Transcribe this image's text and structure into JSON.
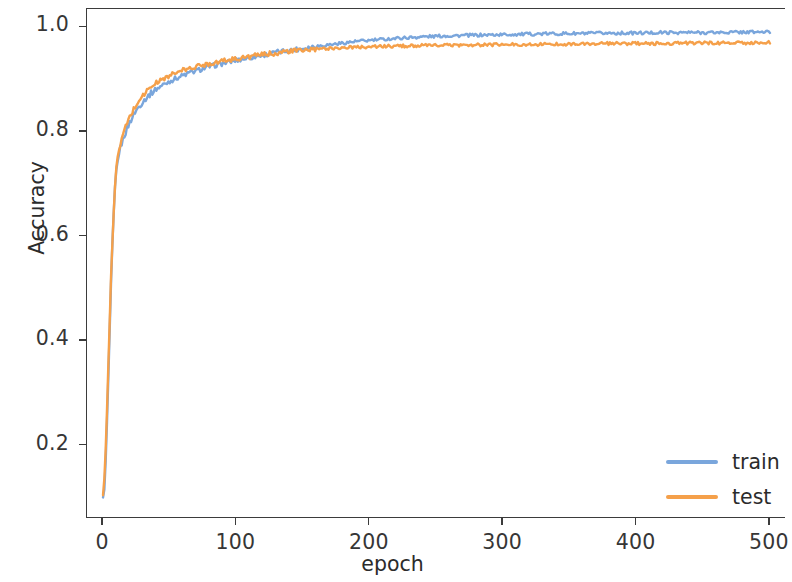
{
  "chart_data": {
    "type": "line",
    "title": "",
    "xlabel": "epoch",
    "ylabel": "Accuracy",
    "xlim": [
      -12,
      512
    ],
    "ylim": [
      0.06,
      1.035
    ],
    "xticks": [
      0,
      100,
      200,
      300,
      400,
      500
    ],
    "xticklabels": [
      "0",
      "100",
      "200",
      "300",
      "400",
      "500"
    ],
    "yticks": [
      0.2,
      0.4,
      0.6,
      0.8,
      1.0
    ],
    "yticklabels": [
      "0.2",
      "0.4",
      "0.6",
      "0.8",
      "1.0"
    ],
    "grid": false,
    "legend_position": "lower right",
    "colors": {
      "train": "#7aa6dc",
      "test": "#f5a04a",
      "axis": "#3b3b3b",
      "text": "#2b2b2b",
      "background": "#ffffff"
    },
    "series": [
      {
        "name": "train",
        "color": "#7aa6dc",
        "x": [
          0,
          1,
          2,
          3,
          4,
          5,
          6,
          7,
          8,
          9,
          10,
          12,
          14,
          16,
          18,
          20,
          24,
          28,
          32,
          36,
          40,
          45,
          50,
          55,
          60,
          65,
          70,
          75,
          80,
          90,
          100,
          110,
          120,
          130,
          140,
          150,
          160,
          170,
          180,
          190,
          200,
          220,
          240,
          260,
          280,
          300,
          320,
          340,
          360,
          380,
          400,
          420,
          440,
          460,
          480,
          500
        ],
        "y": [
          0.1,
          0.118,
          0.17,
          0.245,
          0.33,
          0.42,
          0.505,
          0.58,
          0.64,
          0.69,
          0.725,
          0.76,
          0.778,
          0.793,
          0.806,
          0.818,
          0.838,
          0.852,
          0.864,
          0.874,
          0.882,
          0.89,
          0.897,
          0.903,
          0.908,
          0.913,
          0.917,
          0.921,
          0.925,
          0.931,
          0.937,
          0.942,
          0.947,
          0.952,
          0.956,
          0.96,
          0.964,
          0.967,
          0.97,
          0.973,
          0.975,
          0.979,
          0.982,
          0.984,
          0.985,
          0.986,
          0.987,
          0.988,
          0.988,
          0.989,
          0.989,
          0.99,
          0.99,
          0.99,
          0.991,
          0.991
        ]
      },
      {
        "name": "test",
        "color": "#f5a04a",
        "x": [
          0,
          1,
          2,
          3,
          4,
          5,
          6,
          7,
          8,
          9,
          10,
          12,
          14,
          16,
          18,
          20,
          24,
          28,
          32,
          36,
          40,
          45,
          50,
          55,
          60,
          65,
          70,
          75,
          80,
          90,
          100,
          110,
          120,
          130,
          140,
          150,
          160,
          170,
          180,
          190,
          200,
          220,
          240,
          260,
          280,
          300,
          320,
          340,
          360,
          380,
          400,
          420,
          440,
          460,
          480,
          500
        ],
        "y": [
          0.105,
          0.135,
          0.195,
          0.27,
          0.352,
          0.438,
          0.518,
          0.59,
          0.648,
          0.696,
          0.73,
          0.766,
          0.786,
          0.802,
          0.816,
          0.828,
          0.848,
          0.864,
          0.876,
          0.886,
          0.894,
          0.901,
          0.908,
          0.913,
          0.918,
          0.921,
          0.925,
          0.928,
          0.931,
          0.936,
          0.94,
          0.944,
          0.948,
          0.951,
          0.954,
          0.956,
          0.958,
          0.96,
          0.961,
          0.962,
          0.963,
          0.964,
          0.965,
          0.966,
          0.966,
          0.967,
          0.967,
          0.968,
          0.968,
          0.969,
          0.969,
          0.969,
          0.97,
          0.97,
          0.97,
          0.971
        ]
      }
    ],
    "noise_amplitude": 0.0055,
    "legend_entries": [
      {
        "label": "train",
        "color": "#7aa6dc"
      },
      {
        "label": "test",
        "color": "#f5a04a"
      }
    ]
  }
}
